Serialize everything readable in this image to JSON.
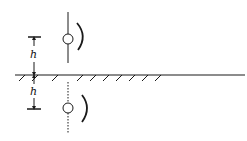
{
  "diagram": {
    "colors": {
      "stroke": "#1a1a1a",
      "background": "#ffffff"
    },
    "labels": {
      "upper_height": "h",
      "lower_height": "h"
    },
    "elements": [
      {
        "id": "ground-plane",
        "type": "hatched-line",
        "y": 75
      },
      {
        "id": "real-source",
        "type": "circle-on-solid-line",
        "cx": 68,
        "cy": 39
      },
      {
        "id": "real-source-wave",
        "type": "arc",
        "side": "right"
      },
      {
        "id": "image-source",
        "type": "circle-on-dotted-line",
        "cx": 68,
        "cy": 108
      },
      {
        "id": "image-source-wave",
        "type": "arc",
        "side": "right"
      },
      {
        "id": "dimension-upper",
        "type": "dimension-arrow",
        "label": "h"
      },
      {
        "id": "dimension-lower",
        "type": "dimension-arrow",
        "label": "h"
      }
    ]
  }
}
